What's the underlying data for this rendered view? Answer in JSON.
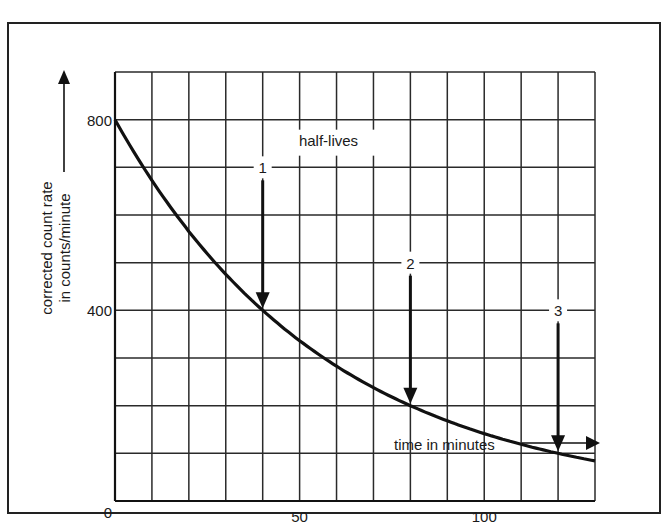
{
  "chart_data": {
    "type": "line",
    "title": "",
    "xlabel": "time in minutes",
    "ylabel": "corrected count rate in counts/minute",
    "ylabel_lines": [
      "corrected count rate",
      "in counts/minute"
    ],
    "xlim": [
      0,
      130
    ],
    "ylim": [
      0,
      900
    ],
    "x_ticks": [
      0,
      50,
      100
    ],
    "y_ticks": [
      0,
      400,
      800
    ],
    "x_tick_labels": [
      "0",
      "50",
      "100"
    ],
    "y_tick_labels": [
      "0",
      "400",
      "800"
    ],
    "grid": true,
    "grid_x_step": 10,
    "grid_y_step": 100,
    "series": [
      {
        "name": "decay curve",
        "x": [
          0,
          10,
          20,
          30,
          40,
          50,
          60,
          70,
          80,
          90,
          100,
          110,
          120,
          130
        ],
        "values": [
          800,
          673,
          566,
          476,
          400,
          336,
          283,
          238,
          200,
          168,
          141,
          119,
          100,
          84
        ]
      }
    ],
    "annotations": {
      "heading": "half-lives",
      "markers": [
        {
          "label": "1",
          "x": 40,
          "y": 400
        },
        {
          "label": "2",
          "x": 80,
          "y": 200
        },
        {
          "label": "3",
          "x": 120,
          "y": 100
        }
      ]
    },
    "legend": "none"
  }
}
